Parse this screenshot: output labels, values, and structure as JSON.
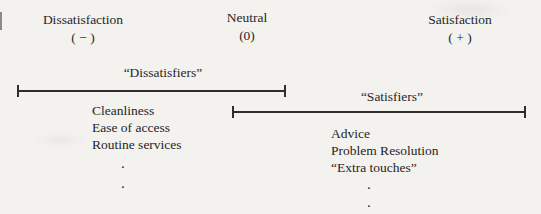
{
  "figure": {
    "background": "#f3f2ef",
    "ink": "#262626",
    "bar_color": "#2e2e2e"
  },
  "scale": {
    "poles": [
      {
        "label": "Dissatisfaction",
        "sign": "( − )"
      },
      {
        "label": "Neutral",
        "sign": "(0)"
      },
      {
        "label": "Satisfaction",
        "sign": "( + )"
      }
    ]
  },
  "ranges": [
    {
      "title": "“Dissatisfiers”",
      "items": [
        "Cleanliness",
        "Ease of access",
        "Routine services"
      ],
      "ellipsis_dots": [
        ".",
        "."
      ]
    },
    {
      "title": "“Satisfiers”",
      "items": [
        "Advice",
        "Problem Resolution",
        "“Extra touches”"
      ],
      "ellipsis_dots": [
        ".",
        "."
      ]
    }
  ]
}
